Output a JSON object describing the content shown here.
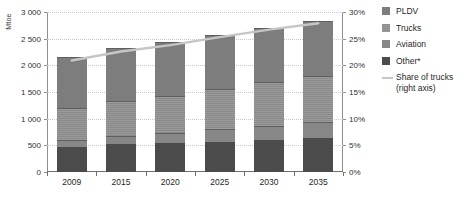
{
  "chart_data": {
    "type": "bar",
    "title": "",
    "subtitle": "",
    "ylabel": "Mtoe",
    "xlabel": "",
    "categories": [
      "2009",
      "2015",
      "2020",
      "2025",
      "2030",
      "2035"
    ],
    "ylim": [
      0,
      3000
    ],
    "yticks": [
      "0",
      "500",
      "1 000",
      "1 500",
      "2 000",
      "2 500",
      "3 000"
    ],
    "ytick_values": [
      0,
      500,
      1000,
      1500,
      2000,
      2500,
      3000
    ],
    "y2lim": [
      0,
      30
    ],
    "y2label": "",
    "y2ticks": [
      "0%",
      "5%",
      "10%",
      "15%",
      "20%",
      "25%",
      "30%"
    ],
    "y2tick_values": [
      0,
      5,
      10,
      15,
      20,
      25,
      30
    ],
    "grid": true,
    "legend_position": "right",
    "stacked": true,
    "series": [
      {
        "name": "PLDV",
        "values": [
          950,
          990,
          1010,
          1020,
          1020,
          1040
        ]
      },
      {
        "name": "Trucks",
        "values": [
          600,
          660,
          700,
          750,
          810,
          870
        ]
      },
      {
        "name": "Aviation",
        "values": [
          135,
          160,
          185,
          230,
          270,
          300
        ]
      },
      {
        "name": "Other*",
        "values": [
          465,
          520,
          545,
          570,
          600,
          630
        ]
      }
    ],
    "stack_order_bottom_to_top": [
      "Other*",
      "Aviation",
      "Trucks",
      "PLDV"
    ],
    "totals": [
      2150,
      2330,
      2440,
      2570,
      2700,
      2840
    ],
    "line_series": {
      "name": "Share of trucks (right axis)",
      "axis": "right",
      "unit": "%",
      "values": [
        20.9,
        22.6,
        23.8,
        25.3,
        26.7,
        27.9
      ],
      "color": "#c6c6c6"
    }
  },
  "legend": {
    "items": [
      {
        "label": "PLDV",
        "swatch": "#7d7d7d",
        "type": "swatch"
      },
      {
        "label": "Trucks",
        "swatch": "#8a8a8a",
        "type": "swatch"
      },
      {
        "label": "Aviation",
        "swatch": "#878787",
        "type": "swatch"
      },
      {
        "label": "Other*",
        "swatch": "#4b4b4b",
        "type": "swatch"
      }
    ],
    "line_item": {
      "label_line1": "Share of trucks",
      "label_line2": "(right axis)",
      "color": "#c6c6c6"
    }
  },
  "colors": {
    "pldv": "#7d7d7d",
    "trucks": "#8a8a8a",
    "aviation": "#878787",
    "other": "#4b4b4b",
    "line": "#c6c6c6",
    "grid": "#c9c9c9",
    "axis": "#8f8f8f",
    "text": "#1f1f1f"
  }
}
